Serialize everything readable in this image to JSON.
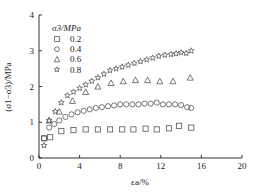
{
  "chart_data": {
    "type": "scatter",
    "title": "",
    "xlabel": "εa/%",
    "ylabel": "(σ1−σ3)/MPa",
    "xlim": [
      0,
      20
    ],
    "ylim": [
      0,
      4
    ],
    "xticks": [
      0,
      4,
      8,
      12,
      16,
      20
    ],
    "yticks": [
      0,
      1,
      2,
      3,
      4
    ],
    "grid": false,
    "legend": {
      "title": "σ3/MPa",
      "position": "upper-left"
    },
    "series": [
      {
        "name": "0.2",
        "marker": "square",
        "x": [
          0.5,
          1.1,
          2.2,
          3.4,
          4.6,
          5.8,
          7.0,
          8.2,
          9.3,
          10.5,
          11.6,
          12.8,
          13.8,
          15.0
        ],
        "y": [
          0.55,
          0.58,
          0.75,
          0.78,
          0.8,
          0.8,
          0.8,
          0.8,
          0.8,
          0.82,
          0.8,
          0.83,
          0.9,
          0.85
        ]
      },
      {
        "name": "0.4",
        "marker": "circle",
        "x": [
          0.5,
          1.0,
          1.5,
          2.0,
          2.6,
          3.2,
          3.8,
          4.4,
          5.0,
          5.6,
          6.2,
          6.8,
          7.4,
          8.0,
          8.6,
          9.2,
          9.8,
          10.4,
          11.0,
          11.6,
          12.2,
          12.8,
          13.4,
          14.0,
          14.6,
          15.0
        ],
        "y": [
          0.55,
          0.85,
          0.95,
          1.05,
          1.15,
          1.22,
          1.28,
          1.32,
          1.36,
          1.4,
          1.42,
          1.45,
          1.47,
          1.5,
          1.5,
          1.5,
          1.5,
          1.52,
          1.52,
          1.55,
          1.5,
          1.5,
          1.5,
          1.48,
          1.42,
          1.4
        ]
      },
      {
        "name": "0.6",
        "marker": "triangle",
        "x": [
          1.0,
          2.0,
          3.3,
          4.6,
          5.8,
          7.1,
          8.3,
          9.5,
          10.7,
          11.9,
          13.2,
          14.9
        ],
        "y": [
          1.05,
          1.3,
          1.6,
          1.85,
          2.0,
          2.1,
          2.15,
          2.18,
          2.18,
          2.15,
          2.15,
          2.25
        ]
      },
      {
        "name": "0.8",
        "marker": "star",
        "x": [
          0.5,
          1.0,
          1.6,
          2.2,
          2.8,
          3.4,
          4.0,
          4.6,
          5.2,
          5.8,
          6.4,
          7.0,
          7.6,
          8.2,
          8.8,
          9.4,
          10.0,
          10.6,
          11.2,
          11.8,
          12.4,
          13.0,
          13.5,
          14.0,
          14.5,
          15.0
        ],
        "y": [
          0.35,
          1.05,
          1.3,
          1.55,
          1.75,
          1.85,
          1.95,
          2.05,
          2.15,
          2.25,
          2.35,
          2.45,
          2.5,
          2.55,
          2.6,
          2.65,
          2.7,
          2.75,
          2.8,
          2.85,
          2.88,
          2.9,
          2.92,
          2.95,
          2.93,
          3.0
        ]
      }
    ]
  },
  "colors": {
    "axis": "#333333",
    "marker": "#555555",
    "background": "#ffffff"
  }
}
